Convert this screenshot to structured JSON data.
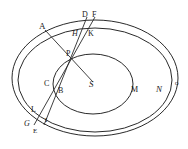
{
  "diagram": {
    "colors": {
      "ink": "#2a2a2a",
      "background": "#ffffff"
    },
    "ellipses": [
      {
        "id": "outer-O",
        "cx": 95,
        "cy": 78,
        "rx": 83,
        "ry": 58
      },
      {
        "id": "middle-N",
        "cx": 95,
        "cy": 80,
        "rx": 77,
        "ry": 52
      },
      {
        "id": "inner-M",
        "cx": 93,
        "cy": 84,
        "rx": 40,
        "ry": 30
      }
    ],
    "lines": [
      {
        "id": "A-S",
        "x1": 45,
        "y1": 30,
        "x2": 93,
        "y2": 82
      },
      {
        "id": "D-E",
        "x1": 87,
        "y1": 17,
        "x2": 44,
        "y2": 125
      },
      {
        "id": "F-G",
        "x1": 95,
        "y1": 17,
        "x2": 34,
        "y2": 125
      }
    ],
    "labels": {
      "A": "A",
      "D": "D",
      "F": "F",
      "H": "H",
      "K": "K",
      "P": "P",
      "C": "C",
      "B": "B",
      "S": "S",
      "M": "M",
      "N": "N",
      "O": "O",
      "L": "L",
      "G": "G",
      "I": "I",
      "E": "E"
    }
  }
}
